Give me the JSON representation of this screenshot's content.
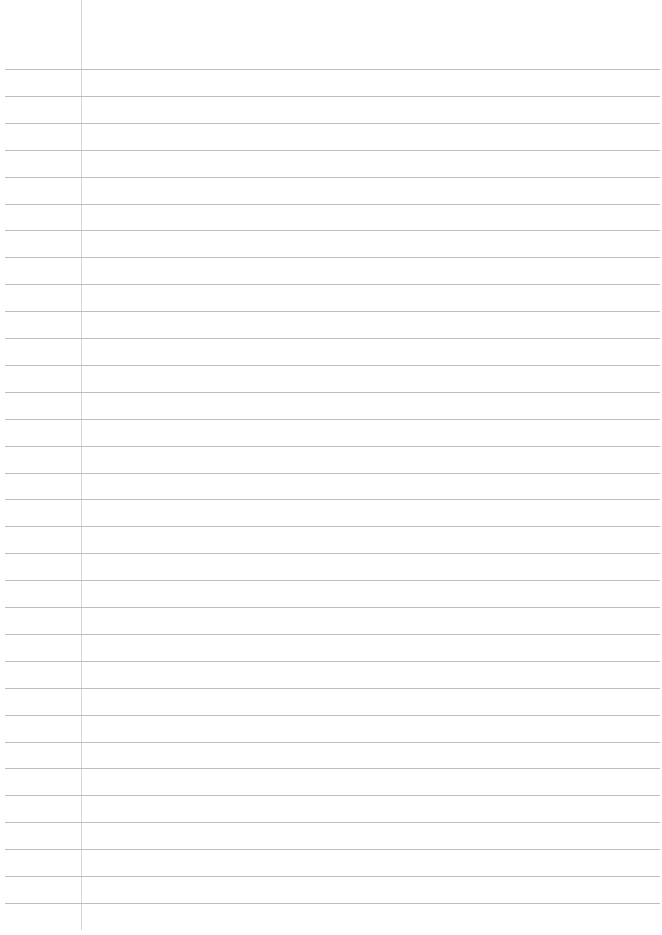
{
  "page": {
    "type": "blank-lined-paper",
    "line_count": 32,
    "first_line_y": 69,
    "line_spacing": 26.9,
    "margin_x": 81,
    "colors": {
      "background": "#ffffff",
      "rule": "#bdbdbd",
      "margin": "#d6d6d6"
    }
  }
}
